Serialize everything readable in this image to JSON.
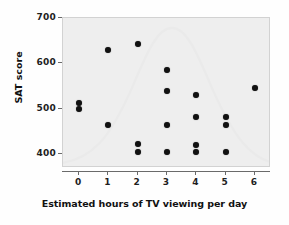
{
  "chart_data": {
    "type": "scatter",
    "title": "",
    "xlabel": "Estimated hours of TV viewing per day",
    "ylabel": "SAT score",
    "xlim": [
      -0.55,
      6.55
    ],
    "ylim": [
      370,
      700
    ],
    "xticks": [
      0,
      1,
      2,
      3,
      4,
      5,
      6
    ],
    "xtick_labels": [
      "0",
      "1",
      "2",
      "3",
      "4",
      "5",
      "6"
    ],
    "yticks": [
      400,
      500,
      600,
      700
    ],
    "ytick_labels": [
      "400",
      "500",
      "600",
      "700"
    ],
    "grid": false,
    "legend": null,
    "marker": "filled-circle",
    "marker_color": "#111111",
    "plot_background": "#eeeeee",
    "points": [
      {
        "x": 0,
        "y": 512
      },
      {
        "x": 0,
        "y": 500
      },
      {
        "x": 1,
        "y": 630
      },
      {
        "x": 1,
        "y": 465
      },
      {
        "x": 2,
        "y": 643
      },
      {
        "x": 2,
        "y": 422
      },
      {
        "x": 2,
        "y": 405
      },
      {
        "x": 3,
        "y": 585
      },
      {
        "x": 3,
        "y": 540
      },
      {
        "x": 3,
        "y": 465
      },
      {
        "x": 3,
        "y": 405
      },
      {
        "x": 4,
        "y": 530
      },
      {
        "x": 4,
        "y": 483
      },
      {
        "x": 4,
        "y": 420
      },
      {
        "x": 4,
        "y": 405
      },
      {
        "x": 5,
        "y": 483
      },
      {
        "x": 5,
        "y": 465
      },
      {
        "x": 5,
        "y": 405
      },
      {
        "x": 6,
        "y": 545
      }
    ]
  }
}
